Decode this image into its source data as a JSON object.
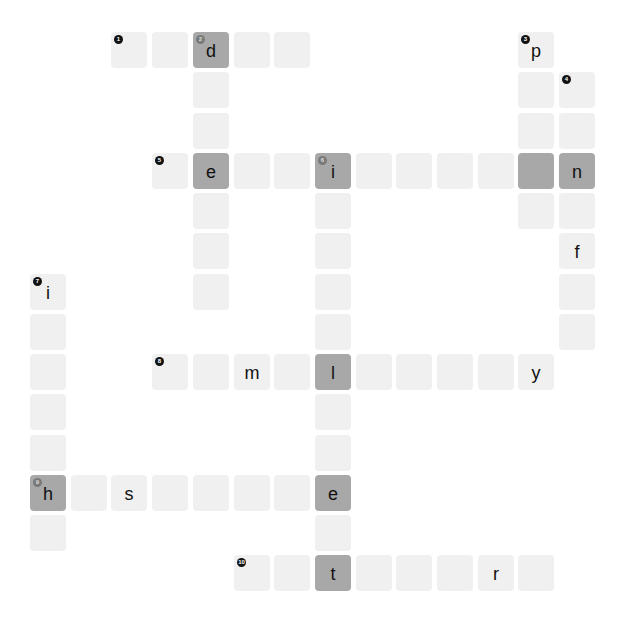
{
  "puzzle": {
    "cells": [
      {
        "r": 0,
        "c": 2,
        "num": "1",
        "letter": "",
        "dark": false
      },
      {
        "r": 0,
        "c": 3,
        "num": "",
        "letter": "",
        "dark": false
      },
      {
        "r": 0,
        "c": 4,
        "num": "2",
        "letter": "d",
        "dark": true
      },
      {
        "r": 0,
        "c": 5,
        "num": "",
        "letter": "",
        "dark": false
      },
      {
        "r": 0,
        "c": 6,
        "num": "",
        "letter": "",
        "dark": false
      },
      {
        "r": 0,
        "c": 12,
        "num": "3",
        "letter": "p",
        "dark": false
      },
      {
        "r": 1,
        "c": 4,
        "num": "",
        "letter": "",
        "dark": false
      },
      {
        "r": 1,
        "c": 12,
        "num": "",
        "letter": "",
        "dark": false
      },
      {
        "r": 1,
        "c": 13,
        "num": "4",
        "letter": "",
        "dark": false
      },
      {
        "r": 2,
        "c": 4,
        "num": "",
        "letter": "",
        "dark": false
      },
      {
        "r": 2,
        "c": 12,
        "num": "",
        "letter": "",
        "dark": false
      },
      {
        "r": 2,
        "c": 13,
        "num": "",
        "letter": "",
        "dark": false
      },
      {
        "r": 3,
        "c": 3,
        "num": "5",
        "letter": "",
        "dark": false
      },
      {
        "r": 3,
        "c": 4,
        "num": "",
        "letter": "e",
        "dark": true
      },
      {
        "r": 3,
        "c": 5,
        "num": "",
        "letter": "",
        "dark": false
      },
      {
        "r": 3,
        "c": 6,
        "num": "",
        "letter": "",
        "dark": false
      },
      {
        "r": 3,
        "c": 7,
        "num": "6",
        "letter": "i",
        "dark": true
      },
      {
        "r": 3,
        "c": 8,
        "num": "",
        "letter": "",
        "dark": false
      },
      {
        "r": 3,
        "c": 9,
        "num": "",
        "letter": "",
        "dark": false
      },
      {
        "r": 3,
        "c": 10,
        "num": "",
        "letter": "",
        "dark": false
      },
      {
        "r": 3,
        "c": 11,
        "num": "",
        "letter": "",
        "dark": false
      },
      {
        "r": 3,
        "c": 12,
        "num": "",
        "letter": "",
        "dark": true
      },
      {
        "r": 3,
        "c": 13,
        "num": "",
        "letter": "n",
        "dark": true
      },
      {
        "r": 4,
        "c": 4,
        "num": "",
        "letter": "",
        "dark": false
      },
      {
        "r": 4,
        "c": 7,
        "num": "",
        "letter": "",
        "dark": false
      },
      {
        "r": 4,
        "c": 12,
        "num": "",
        "letter": "",
        "dark": false
      },
      {
        "r": 4,
        "c": 13,
        "num": "",
        "letter": "",
        "dark": false
      },
      {
        "r": 5,
        "c": 4,
        "num": "",
        "letter": "",
        "dark": false
      },
      {
        "r": 5,
        "c": 7,
        "num": "",
        "letter": "",
        "dark": false
      },
      {
        "r": 5,
        "c": 13,
        "num": "",
        "letter": "f",
        "dark": false
      },
      {
        "r": 6,
        "c": 0,
        "num": "7",
        "letter": "i",
        "dark": false
      },
      {
        "r": 6,
        "c": 4,
        "num": "",
        "letter": "",
        "dark": false
      },
      {
        "r": 6,
        "c": 7,
        "num": "",
        "letter": "",
        "dark": false
      },
      {
        "r": 6,
        "c": 13,
        "num": "",
        "letter": "",
        "dark": false
      },
      {
        "r": 7,
        "c": 0,
        "num": "",
        "letter": "",
        "dark": false
      },
      {
        "r": 7,
        "c": 7,
        "num": "",
        "letter": "",
        "dark": false
      },
      {
        "r": 7,
        "c": 13,
        "num": "",
        "letter": "",
        "dark": false
      },
      {
        "r": 8,
        "c": 0,
        "num": "",
        "letter": "",
        "dark": false
      },
      {
        "r": 8,
        "c": 3,
        "num": "8",
        "letter": "",
        "dark": false
      },
      {
        "r": 8,
        "c": 4,
        "num": "",
        "letter": "",
        "dark": false
      },
      {
        "r": 8,
        "c": 5,
        "num": "",
        "letter": "m",
        "dark": false
      },
      {
        "r": 8,
        "c": 6,
        "num": "",
        "letter": "",
        "dark": false
      },
      {
        "r": 8,
        "c": 7,
        "num": "",
        "letter": "l",
        "dark": true
      },
      {
        "r": 8,
        "c": 8,
        "num": "",
        "letter": "",
        "dark": false
      },
      {
        "r": 8,
        "c": 9,
        "num": "",
        "letter": "",
        "dark": false
      },
      {
        "r": 8,
        "c": 10,
        "num": "",
        "letter": "",
        "dark": false
      },
      {
        "r": 8,
        "c": 11,
        "num": "",
        "letter": "",
        "dark": false
      },
      {
        "r": 8,
        "c": 12,
        "num": "",
        "letter": "y",
        "dark": false
      },
      {
        "r": 9,
        "c": 0,
        "num": "",
        "letter": "",
        "dark": false
      },
      {
        "r": 9,
        "c": 7,
        "num": "",
        "letter": "",
        "dark": false
      },
      {
        "r": 10,
        "c": 0,
        "num": "",
        "letter": "",
        "dark": false
      },
      {
        "r": 10,
        "c": 7,
        "num": "",
        "letter": "",
        "dark": false
      },
      {
        "r": 11,
        "c": 0,
        "num": "9",
        "letter": "h",
        "dark": true
      },
      {
        "r": 11,
        "c": 1,
        "num": "",
        "letter": "",
        "dark": false
      },
      {
        "r": 11,
        "c": 2,
        "num": "",
        "letter": "s",
        "dark": false
      },
      {
        "r": 11,
        "c": 3,
        "num": "",
        "letter": "",
        "dark": false
      },
      {
        "r": 11,
        "c": 4,
        "num": "",
        "letter": "",
        "dark": false
      },
      {
        "r": 11,
        "c": 5,
        "num": "",
        "letter": "",
        "dark": false
      },
      {
        "r": 11,
        "c": 6,
        "num": "",
        "letter": "",
        "dark": false
      },
      {
        "r": 11,
        "c": 7,
        "num": "",
        "letter": "e",
        "dark": true
      },
      {
        "r": 12,
        "c": 0,
        "num": "",
        "letter": "",
        "dark": false
      },
      {
        "r": 12,
        "c": 7,
        "num": "",
        "letter": "",
        "dark": false
      },
      {
        "r": 13,
        "c": 5,
        "num": "10",
        "letter": "",
        "dark": false
      },
      {
        "r": 13,
        "c": 6,
        "num": "",
        "letter": "",
        "dark": false
      },
      {
        "r": 13,
        "c": 7,
        "num": "",
        "letter": "t",
        "dark": true
      },
      {
        "r": 13,
        "c": 8,
        "num": "",
        "letter": "",
        "dark": false
      },
      {
        "r": 13,
        "c": 9,
        "num": "",
        "letter": "",
        "dark": false
      },
      {
        "r": 13,
        "c": 10,
        "num": "",
        "letter": "",
        "dark": false
      },
      {
        "r": 13,
        "c": 11,
        "num": "",
        "letter": "r",
        "dark": false
      },
      {
        "r": 13,
        "c": 12,
        "num": "",
        "letter": "",
        "dark": false
      }
    ],
    "colors": {
      "cell": "#f0f0f0",
      "dark_cell": "#a8a8a8",
      "text": "#111111"
    }
  }
}
